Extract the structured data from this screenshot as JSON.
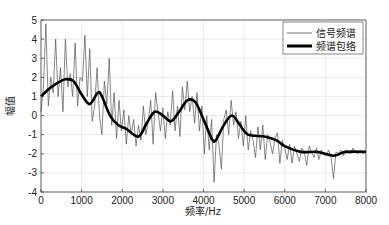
{
  "chart_data": {
    "type": "line",
    "title": "",
    "xlabel": "频率/Hz",
    "ylabel": "幅值",
    "xlim": [
      0,
      8000
    ],
    "ylim": [
      -4,
      5
    ],
    "xticks": [
      0,
      1000,
      2000,
      3000,
      4000,
      5000,
      6000,
      7000,
      8000
    ],
    "yticks": [
      -4,
      -3,
      -2,
      -1,
      0,
      1,
      2,
      3,
      4,
      5
    ],
    "xtick_labels": [
      "0",
      "1000",
      "2000",
      "3000",
      "4000",
      "5000",
      "6000",
      "7000",
      "8000"
    ],
    "ytick_labels": [
      "-4",
      "-3",
      "-2",
      "-1",
      "0",
      "1",
      "2",
      "3",
      "4",
      "5"
    ],
    "grid": true,
    "legend": {
      "position": "top-right",
      "entries": [
        "信号频谱",
        "频谱包络"
      ]
    },
    "series": [
      {
        "name": "频谱包络",
        "style": "thick",
        "color": "#000000",
        "x": [
          0,
          200,
          400,
          600,
          800,
          1000,
          1200,
          1400,
          1500,
          1700,
          1900,
          2100,
          2400,
          2600,
          2800,
          3000,
          3200,
          3400,
          3600,
          3800,
          4000,
          4200,
          4300,
          4500,
          4700,
          4900,
          5100,
          5500,
          5800,
          6000,
          6400,
          6800,
          7200,
          7500,
          8000
        ],
        "y": [
          1.0,
          1.4,
          1.7,
          1.9,
          1.8,
          1.1,
          0.6,
          1.2,
          1.0,
          0.0,
          -0.5,
          -0.7,
          -1.1,
          -0.4,
          0.2,
          0.0,
          -0.3,
          0.2,
          0.8,
          0.7,
          -0.2,
          -1.2,
          -1.3,
          -0.5,
          0.0,
          -0.5,
          -1.0,
          -1.1,
          -1.3,
          -1.6,
          -1.9,
          -1.9,
          -2.1,
          -1.9,
          -1.9
        ]
      },
      {
        "name": "信号频谱",
        "style": "thin",
        "color": "#555555",
        "x": [
          0,
          60,
          120,
          180,
          240,
          300,
          360,
          420,
          480,
          540,
          600,
          660,
          720,
          780,
          840,
          900,
          960,
          1020,
          1080,
          1140,
          1200,
          1260,
          1320,
          1380,
          1440,
          1500,
          1560,
          1620,
          1680,
          1740,
          1800,
          1860,
          1920,
          1980,
          2040,
          2100,
          2160,
          2220,
          2280,
          2340,
          2400,
          2460,
          2520,
          2580,
          2640,
          2700,
          2760,
          2820,
          2880,
          2940,
          3000,
          3060,
          3120,
          3180,
          3240,
          3300,
          3360,
          3420,
          3480,
          3540,
          3600,
          3660,
          3720,
          3780,
          3840,
          3900,
          3960,
          4020,
          4080,
          4140,
          4200,
          4260,
          4320,
          4380,
          4440,
          4500,
          4560,
          4620,
          4680,
          4740,
          4800,
          4860,
          4920,
          4980,
          5040,
          5100,
          5160,
          5220,
          5280,
          5340,
          5400,
          5460,
          5520,
          5580,
          5640,
          5700,
          5760,
          5820,
          5880,
          5940,
          6000,
          6060,
          6120,
          6180,
          6240,
          6300,
          6360,
          6420,
          6480,
          6540,
          6600,
          6660,
          6720,
          6780,
          6840,
          6900,
          6960,
          7020,
          7080,
          7140,
          7200,
          7260,
          7320,
          7380,
          7440,
          7500,
          7560,
          7620,
          7680,
          7740,
          7800,
          7860,
          7920,
          7980
        ],
        "y": [
          0.2,
          1.5,
          4.8,
          0.5,
          2.0,
          1.2,
          4.0,
          1.0,
          2.5,
          0.2,
          4.0,
          1.5,
          2.2,
          1.0,
          3.8,
          0.5,
          2.0,
          1.8,
          4.2,
          1.0,
          3.5,
          -0.3,
          0.5,
          2.5,
          0.0,
          -1.0,
          1.8,
          0.6,
          3.0,
          -0.5,
          1.2,
          -1.2,
          0.8,
          -0.8,
          0.3,
          -1.5,
          0.0,
          -1.0,
          -0.2,
          -1.6,
          -0.5,
          -1.3,
          0.5,
          -1.0,
          -0.3,
          0.8,
          -1.5,
          1.2,
          0.2,
          -0.8,
          0.4,
          -1.2,
          0.2,
          -0.5,
          1.3,
          -0.8,
          0.5,
          -1.1,
          1.5,
          0.3,
          1.8,
          0.2,
          1.0,
          -0.4,
          1.2,
          -0.8,
          0.5,
          -2.0,
          0.0,
          -1.8,
          -0.2,
          -3.5,
          -1.0,
          -1.5,
          -2.8,
          -0.2,
          0.3,
          -1.0,
          0.8,
          -0.5,
          0.2,
          -1.2,
          -0.3,
          -1.6,
          0.0,
          -1.8,
          -0.8,
          -1.3,
          -2.2,
          -0.6,
          -1.8,
          -0.5,
          -2.3,
          -1.0,
          -1.4,
          -2.0,
          -1.2,
          -0.9,
          -2.5,
          -1.3,
          -1.7,
          -2.3,
          -1.5,
          -2.5,
          -1.6,
          -2.0,
          -2.4,
          -1.7,
          -1.9,
          -2.6,
          -1.6,
          -1.9,
          -2.2,
          -1.7,
          -2.3,
          -1.8,
          -2.0,
          -2.1,
          -1.8,
          -2.2,
          -3.3,
          -1.9,
          -2.0,
          -1.8,
          -2.1,
          -1.8,
          -1.9,
          -2.0,
          -1.7,
          -1.9,
          -2.0,
          -1.8,
          -2.0,
          -1.9
        ]
      }
    ]
  }
}
